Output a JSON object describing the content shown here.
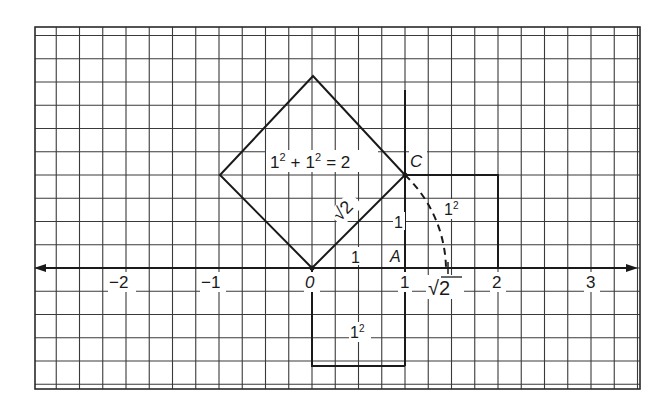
{
  "figure": {
    "equation": "1² + 1² = 2",
    "equation_parts": {
      "one_a": "1",
      "sup_a": "2",
      "plus": "+",
      "one_b": "1",
      "sup_b": "2",
      "equals": "= 2"
    },
    "point_labels": {
      "C": "C",
      "A": "A"
    },
    "side_labels": {
      "hypotenuse": "√2",
      "base": "1",
      "height": "1"
    },
    "square_labels": {
      "right_square": {
        "base": "1",
        "sup": "2"
      },
      "bottom_square": {
        "base": "1",
        "sup": "2"
      }
    },
    "axis": {
      "tick_labels": [
        {
          "value": -2,
          "label": "−2"
        },
        {
          "value": -1,
          "label": "−1"
        },
        {
          "value": 0,
          "label": "0"
        },
        {
          "value": 1,
          "label": "1"
        },
        {
          "value": 2,
          "label": "2"
        },
        {
          "value": 3,
          "label": "3"
        }
      ],
      "sqrt2_label": "√2"
    },
    "colors": {
      "ink": "#1a1a1a",
      "grid": "#3a3a3a",
      "background": "#ffffff"
    }
  }
}
